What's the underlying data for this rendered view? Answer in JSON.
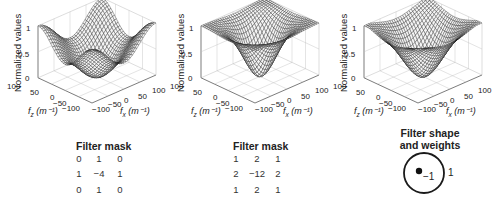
{
  "figure": {
    "panels": [
      {
        "id": "a",
        "ylabel": "Normalized values",
        "z_ticks": [
          "1",
          "0.5",
          "0"
        ],
        "fz_ticks": [
          "100",
          "50",
          "0",
          "−50",
          "−100"
        ],
        "fx_ticks": [
          "−100",
          "−50",
          "0",
          "50",
          "100"
        ],
        "fz_label": "f",
        "fz_sub": "z",
        "fz_unit": " (m⁻¹)",
        "fx_label": "f",
        "fx_sub": "x",
        "fx_unit": " (m⁻¹)",
        "surface": "4-neighbor laplacian",
        "mask": {
          "title": "Filter mask",
          "rows": [
            [
              "0",
              "1",
              "0"
            ],
            [
              "1",
              "−4",
              "1"
            ],
            [
              "0",
              "1",
              "0"
            ]
          ]
        }
      },
      {
        "id": "b",
        "ylabel": "Normalized values",
        "z_ticks": [
          "1",
          "0.5",
          "0"
        ],
        "fz_ticks": [
          "100",
          "50",
          "0",
          "−50",
          "−100"
        ],
        "fx_ticks": [
          "−100",
          "−50",
          "0",
          "50",
          "100"
        ],
        "fz_label": "f",
        "fz_sub": "z",
        "fz_unit": " (m⁻¹)",
        "fx_label": "f",
        "fx_sub": "x",
        "fx_unit": " (m⁻¹)",
        "surface": "8-neighbor weighted laplacian",
        "mask": {
          "title": "Filter mask",
          "rows": [
            [
              "1",
              "2",
              "1"
            ],
            [
              "2",
              "−12",
              "2"
            ],
            [
              "1",
              "2",
              "1"
            ]
          ]
        }
      },
      {
        "id": "c",
        "ylabel": "Normalized values",
        "z_ticks": [
          "1",
          "0.5",
          "0"
        ],
        "fz_ticks": [
          "100",
          "50",
          "0",
          "−50",
          "−100"
        ],
        "fx_ticks": [
          "−100",
          "−50",
          "0",
          "50",
          "100"
        ],
        "fz_label": "f",
        "fz_sub": "z",
        "fz_unit": " (m⁻¹)",
        "fx_label": "f",
        "fx_sub": "x",
        "fx_unit": " (m⁻¹)",
        "surface": "circular filter",
        "shape": {
          "title_line1": "Filter shape",
          "title_line2": "and weights",
          "inner_weight": "−1",
          "outer_weight": "1"
        }
      }
    ]
  }
}
